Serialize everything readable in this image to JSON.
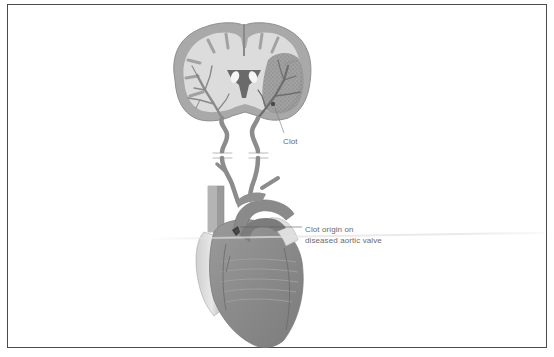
{
  "figure": {
    "type": "anatomical-illustration",
    "parts": [
      "brain-coronal-section",
      "carotid-arteries",
      "heart"
    ]
  },
  "labels": {
    "clot": "Clot",
    "clot_origin_line1": "Clot origin on",
    "clot_origin_line2": "diseased aortic valve"
  },
  "colors": {
    "frame_border": "#4a4a4a",
    "tissue_light": "#d8d8d8",
    "tissue_mid": "#a8a8a8",
    "tissue_dark": "#7a7a7a",
    "vessel": "#8c8c8c",
    "label_text": "#6a6a6a",
    "background": "#ffffff"
  }
}
